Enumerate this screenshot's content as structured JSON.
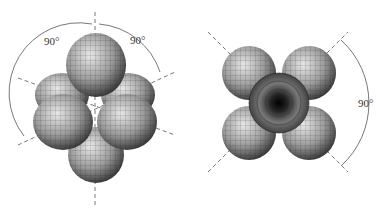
{
  "figure": {
    "left_view": {
      "description": "Side view of six-lobed 3D surface: lobes along vertical axis and four lobes around equator",
      "annotations": [
        {
          "label": "90°",
          "position": "upper-left"
        },
        {
          "label": "90°",
          "position": "upper-right"
        }
      ]
    },
    "right_view": {
      "description": "Top view along vertical axis showing four diagonal lobes with central lobe seen end-on",
      "annotations": [
        {
          "label": "90°",
          "position": "right"
        }
      ]
    },
    "colors": {
      "background": "#ffffff",
      "lobe_light": "#d8d8d8",
      "lobe_dark": "#3a3a3a",
      "mesh": "#2a2a2a",
      "axis": "#555555"
    }
  }
}
